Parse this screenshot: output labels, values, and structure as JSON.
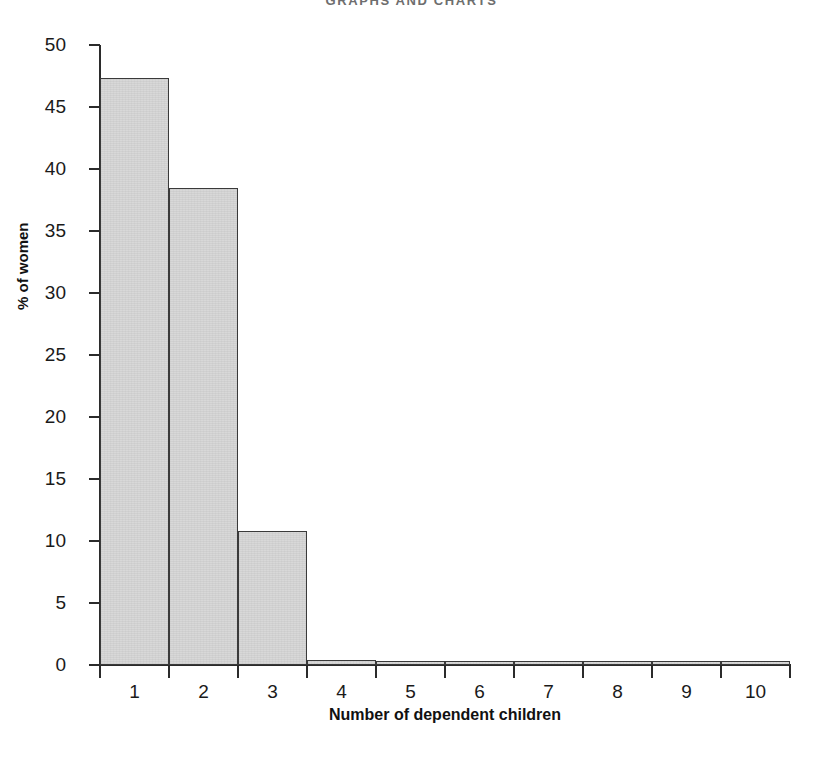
{
  "page": {
    "running_head": "GRAPHS AND CHARTS"
  },
  "chart_data": {
    "type": "bar",
    "title": "",
    "subtitle": "",
    "xlabel": "Number of dependent children",
    "ylabel": "% of women",
    "categories": [
      "1",
      "2",
      "3",
      "4",
      "5",
      "6",
      "7",
      "8",
      "9",
      "10"
    ],
    "values": [
      47.3,
      38.5,
      10.8,
      0.4,
      0.3,
      0.3,
      0.3,
      0.3,
      0.3,
      0.3
    ],
    "xlim": [
      0.5,
      10.5
    ],
    "ylim": [
      0,
      50
    ],
    "ytick_labels": [
      "0",
      "5",
      "10",
      "15",
      "20",
      "25",
      "30",
      "35",
      "40",
      "45",
      "50"
    ],
    "ytick_values": [
      0,
      5,
      10,
      15,
      20,
      25,
      30,
      35,
      40,
      45,
      50
    ],
    "xtick_labels": [
      "1",
      "2",
      "3",
      "4",
      "5",
      "6",
      "7",
      "8",
      "9",
      "10"
    ],
    "grid": false,
    "legend": false,
    "legend_position": "none",
    "bar_fill_color": "#d8d8d8",
    "bar_edge_color": "#3a3a3a",
    "axis_color": "#2b2b2b",
    "text_color": "#1a1a1a",
    "background_color": "#ffffff",
    "histogram_style": true,
    "annotations": []
  }
}
